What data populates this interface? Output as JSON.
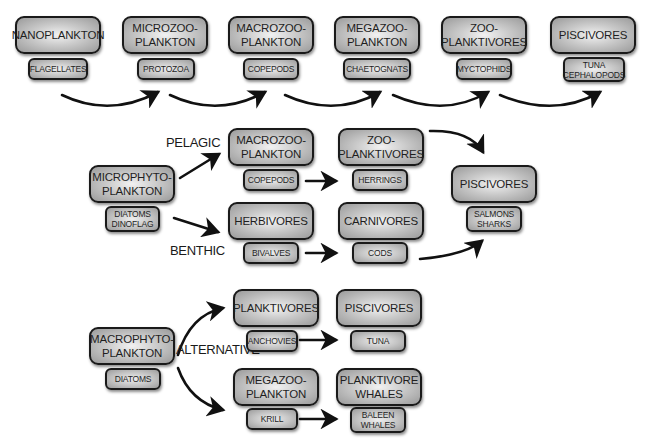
{
  "diagram": {
    "type": "food-web",
    "chain_top": {
      "nodes": [
        {
          "title": "NANOPLANKTON",
          "example": "FLAGELLATES"
        },
        {
          "title": "MICROZOO-\nPLANKTON",
          "example": "PROTOZOA"
        },
        {
          "title": "MACROZOO-\nPLANKTON",
          "example": "COPEPODS"
        },
        {
          "title": "MEGAZOO-\nPLANKTON",
          "example": "CHAETOGNATS"
        },
        {
          "title": "ZOO-\nPLANKTIVORES",
          "example": "MYCTOPHIDS"
        },
        {
          "title": "PISCIVORES",
          "example": "TUNA\nCEPHALOPODS"
        }
      ]
    },
    "chain_middle": {
      "source": {
        "title": "MICROPHYTO-\nPLANKTON",
        "example": "DIATOMS\nDINOFLAG"
      },
      "branch_labels": {
        "upper": "PELAGIC",
        "lower": "BENTHIC"
      },
      "pelagic": [
        {
          "title": "MACROZOO-\nPLANKTON",
          "example": "COPEPODS"
        },
        {
          "title": "ZOO-\nPLANKTIVORES",
          "example": "HERRINGS"
        }
      ],
      "benthic": [
        {
          "title": "HERBIVORES",
          "example": "BIVALVES"
        },
        {
          "title": "CARNIVORES",
          "example": "CODS"
        }
      ],
      "sink": {
        "title": "PISCIVORES",
        "example": "SALMONS\nSHARKS"
      }
    },
    "chain_bottom": {
      "source": {
        "title": "MACROPHYTO-\nPLANKTON",
        "example": "DIATOMS"
      },
      "branch_label": "ALTERNATIVE",
      "upper": [
        {
          "title": "PLANKTIVORES",
          "example": "ANCHOVIES"
        },
        {
          "title": "PISCIVORES",
          "example": "TUNA"
        }
      ],
      "lower": [
        {
          "title": "MEGAZOO-\nPLANKTON",
          "example": "KRILL"
        },
        {
          "title": "PLANKTIVORE\nWHALES",
          "example": "BALEEN\nWHALES"
        }
      ]
    }
  },
  "colors": {
    "box_border": "#1a1a1a",
    "box_fill_center": "#f2f2f2",
    "box_fill_edge": "#9a9a9a",
    "arrow": "#111111",
    "background": "#ffffff"
  }
}
